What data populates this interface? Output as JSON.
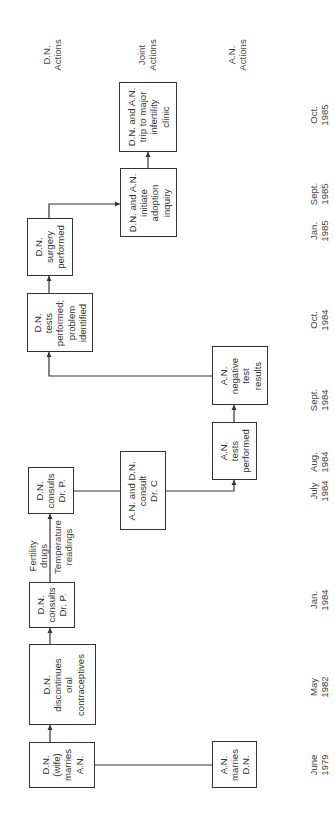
{
  "lanes": [
    {
      "id": "dn",
      "label": "D.N.\nActions",
      "x": 145,
      "y": 83
    },
    {
      "id": "joint",
      "label": "Joint\nActions",
      "x": 148,
      "y": 173
    },
    {
      "id": "an",
      "label": "A.N.\nActions",
      "x": 146,
      "y": 239
    }
  ],
  "dates": [
    {
      "label": "June\n1979",
      "y": 765
    },
    {
      "label": "May\n1982",
      "y": 687
    },
    {
      "label": "Jan.\n1984",
      "y": 600
    },
    {
      "label": "July\n1984",
      "y": 491
    },
    {
      "label": "Aug.\n1984",
      "y": 462
    },
    {
      "label": "Sept.\n1984",
      "y": 400
    },
    {
      "label": "Oct.\n1984",
      "y": 320
    },
    {
      "label": "Jan.\n1985",
      "y": 231
    },
    {
      "label": "Sept.\n1985",
      "y": 194
    },
    {
      "label": "Oct.\n1985",
      "y": 115
    }
  ],
  "boxes": [
    {
      "id": "dn-marries",
      "text": "D.N.\n(wife)\nmarries\nA.N.",
      "x": 29,
      "y": 742,
      "w": 66,
      "h": 46
    },
    {
      "id": "an-marries",
      "text": "A.N.\nmarries\nD.N.",
      "x": 212,
      "y": 741,
      "w": 45,
      "h": 47
    },
    {
      "id": "dn-discontinues",
      "text": "D.N.\ndiscontinues\noral\ncontraceptives",
      "x": 29,
      "y": 644,
      "w": 67,
      "h": 81
    },
    {
      "id": "dn-consults-1",
      "text": "D.N.\nconsults\nDr. P.",
      "x": 29,
      "y": 582,
      "w": 46,
      "h": 46
    },
    {
      "id": "dn-consults-2",
      "text": "D.N.\nconsults\nDr. P.",
      "x": 28,
      "y": 467,
      "w": 46,
      "h": 47
    },
    {
      "id": "joint-consult-drc",
      "text": "A.N. and D.N.\nconsult\nDr. C",
      "x": 120,
      "y": 451,
      "w": 46,
      "h": 79
    },
    {
      "id": "an-tests",
      "text": "A.N.\ntests\nperformed",
      "x": 212,
      "y": 422,
      "w": 45,
      "h": 58
    },
    {
      "id": "an-negative",
      "text": "A.N.\nnegative\ntest\nresults",
      "x": 212,
      "y": 346,
      "w": 56,
      "h": 59
    },
    {
      "id": "dn-tests",
      "text": "D.N.\ntests\nperformed;\nproblem\nidentified",
      "x": 27,
      "y": 293,
      "w": 66,
      "h": 59
    },
    {
      "id": "dn-surgery",
      "text": "D.N.\nsurgery\nperformed",
      "x": 27,
      "y": 218,
      "w": 46,
      "h": 58
    },
    {
      "id": "joint-adoption",
      "text": "D.N. and A.N.\ninitiate\nadoption\ninquiry",
      "x": 120,
      "y": 168,
      "w": 57,
      "h": 69
    },
    {
      "id": "joint-clinic",
      "text": "D.N. and A.N.\ntrip to major\ninfertility\nclinic",
      "x": 119,
      "y": 82,
      "w": 58,
      "h": 70
    }
  ],
  "annotations": [
    {
      "id": "fertility-drugs",
      "text": "Fertility\ndrugs",
      "x": 38,
      "y": 556
    },
    {
      "id": "temperature-readings",
      "text": "Temperature\nreadings",
      "x": 63,
      "y": 547
    }
  ],
  "connectors": [
    {
      "from": "dn-marries",
      "to": "an-marries",
      "path": "M95,765 L212,765",
      "arrow": false
    },
    {
      "from": "dn-marries",
      "to": "dn-discontinues",
      "path": "M50,742 L50,725",
      "arrow": true
    },
    {
      "from": "dn-discontinues",
      "to": "dn-consults-1",
      "path": "M50,644 L50,628",
      "arrow": true
    },
    {
      "from": "dn-consults-1",
      "to": "dn-consults-2",
      "path": "M50,582 L50,514",
      "arrow": true
    },
    {
      "from": "dn-consults-2",
      "to": "joint-consult-drc",
      "path": "M74,491 L120,491",
      "arrow": false
    },
    {
      "from": "joint-consult-drc",
      "to": "an-tests",
      "path": "M166,491 L234,491 L234,480",
      "arrow": true
    },
    {
      "from": "an-tests",
      "to": "an-negative",
      "path": "M234,422 L234,405",
      "arrow": true
    },
    {
      "from": "an-negative",
      "to": "dn-tests",
      "path": "M212,376 L49,376 L49,352",
      "arrow": true
    },
    {
      "from": "dn-tests",
      "to": "dn-surgery",
      "path": "M49,293 L49,276",
      "arrow": true
    },
    {
      "from": "dn-surgery",
      "to": "joint-adoption",
      "path": "M49,218 L49,204 L120,204",
      "arrow": true,
      "dir": "right"
    },
    {
      "from": "joint-adoption",
      "to": "joint-clinic",
      "path": "M148,168 L148,152",
      "arrow": true
    }
  ]
}
